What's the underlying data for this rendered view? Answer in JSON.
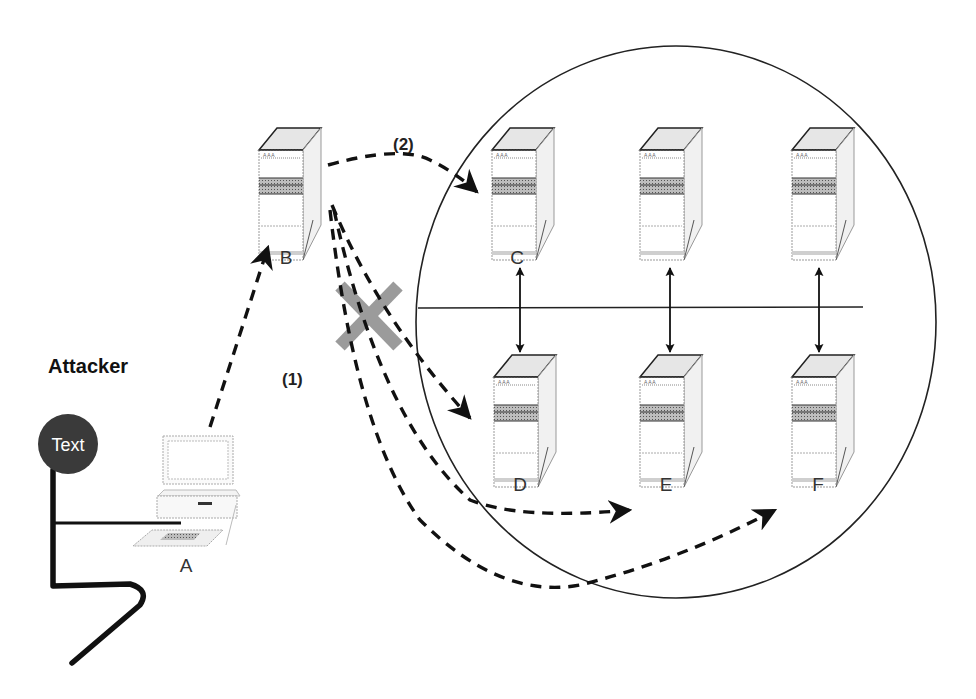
{
  "diagram": {
    "title": "Attacker",
    "attacker_badge": "Text",
    "nodes": [
      {
        "id": "A",
        "label": "A",
        "type": "workstation"
      },
      {
        "id": "B",
        "label": "B",
        "type": "server"
      },
      {
        "id": "C",
        "label": "C",
        "type": "server"
      },
      {
        "id": "D",
        "label": "D",
        "type": "server"
      },
      {
        "id": "E",
        "label": "E",
        "type": "server"
      },
      {
        "id": "F",
        "label": "F",
        "type": "server"
      }
    ],
    "steps": [
      {
        "id": "1",
        "label": "(1)"
      },
      {
        "id": "2",
        "label": "(2)"
      }
    ],
    "edges": [
      {
        "from": "A",
        "to": "B",
        "style": "dashed",
        "step": "1"
      },
      {
        "from": "B",
        "to": "C",
        "style": "dashed",
        "step": "2"
      },
      {
        "from": "B",
        "to": "D",
        "style": "dashed",
        "blocked": true
      },
      {
        "from": "B",
        "to": "E",
        "style": "dashed",
        "blocked": true
      },
      {
        "from": "B",
        "to": "F",
        "style": "dashed",
        "blocked": true
      },
      {
        "from": "C",
        "to": "D",
        "style": "solid",
        "bidirectional": true
      },
      {
        "from": "E-top",
        "to": "E",
        "style": "solid",
        "bidirectional": true
      },
      {
        "from": "F-top",
        "to": "F",
        "style": "solid",
        "bidirectional": true
      }
    ],
    "blocked_marker": "X",
    "colors": {
      "line": "#111111",
      "blocked_x": "#8a8a8a",
      "badge": "#3a3a3a",
      "server_top": "#e4e4e4"
    }
  }
}
